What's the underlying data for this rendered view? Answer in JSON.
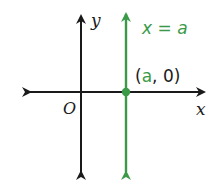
{
  "diagram": {
    "type": "coordinate-plane",
    "axes": {
      "x_label": "x",
      "y_label": "y",
      "origin_label": "O",
      "color": "#1a1a1a"
    },
    "vertical_line": {
      "equation_lhs": "x",
      "equation_eq": " = ",
      "equation_rhs": "a",
      "color": "#3a9a48"
    },
    "point": {
      "open_paren": "(",
      "x_coord": "a",
      "separator": ", ",
      "y_coord": "0",
      "close_paren": ")",
      "color": "#3a9a48"
    }
  }
}
